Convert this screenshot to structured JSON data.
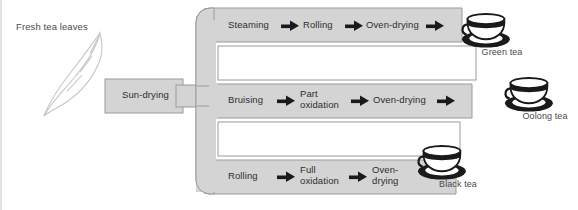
{
  "diagram": {
    "source_label": "Fresh tea leaves",
    "initial_process": "Sun-drying",
    "colors": {
      "band_fill": "#d4d4d4",
      "band_stroke": "#9a9a9a",
      "text": "#2e2e2e",
      "label_text": "#4a4a4a",
      "leaf_stroke": "#c3c3c3",
      "background": "#ffffff"
    },
    "branches": [
      {
        "id": "green",
        "product": "Green tea",
        "steps": [
          "Steaming",
          "Rolling",
          "Oven-drying"
        ],
        "trailing_arrow": true
      },
      {
        "id": "oolong",
        "product": "Oolong tea",
        "steps": [
          "Bruising",
          "Part\noxidation",
          "Oven-drying"
        ],
        "steps_display": [
          "Bruising",
          "Part oxidation",
          "Oven-drying"
        ],
        "trailing_arrow": true
      },
      {
        "id": "black",
        "product": "Black tea",
        "steps": [
          "Rolling",
          "Full\noxidation",
          "Oven-\ndrying"
        ],
        "steps_display": [
          "Rolling",
          "Full oxidation",
          "Oven-drying"
        ],
        "trailing_arrow": false
      }
    ],
    "icons": {
      "leaf": "tea-leaf-icon",
      "cup": "teacup-icon",
      "arrow": "right-arrow-icon"
    }
  }
}
